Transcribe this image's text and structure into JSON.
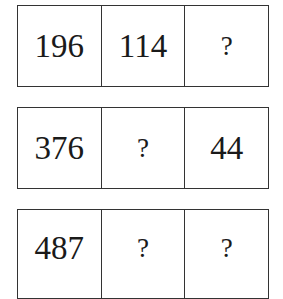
{
  "rows": [
    {
      "cells": [
        "196",
        "114",
        "?"
      ]
    },
    {
      "cells": [
        "376",
        "?",
        "44"
      ]
    },
    {
      "cells": [
        "487",
        "?",
        "?"
      ]
    }
  ]
}
